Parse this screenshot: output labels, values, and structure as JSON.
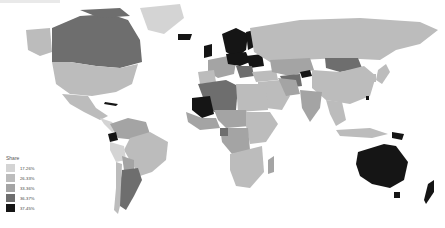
{
  "map": {
    "type": "choropleth",
    "projection": "world",
    "ocean_color": "#ffffff",
    "border_color": "#ffffff"
  },
  "legend": {
    "title": "Share",
    "items": [
      {
        "label": "17-26%",
        "color": "#d4d4d4"
      },
      {
        "label": "26-33%",
        "color": "#bcbcbc"
      },
      {
        "label": "33-36%",
        "color": "#a4a4a4"
      },
      {
        "label": "36-37%",
        "color": "#6e6e6e"
      },
      {
        "label": "37-45%",
        "color": "#151515"
      }
    ]
  },
  "regions": [
    {
      "name": "Canada",
      "bin": "36-37%"
    },
    {
      "name": "United States",
      "bin": "26-33%"
    },
    {
      "name": "Mexico",
      "bin": "26-33%"
    },
    {
      "name": "Greenland",
      "bin": "17-26%"
    },
    {
      "name": "Alaska",
      "bin": "26-33%"
    },
    {
      "name": "Brazil",
      "bin": "26-33%"
    },
    {
      "name": "Argentina",
      "bin": "36-37%"
    },
    {
      "name": "Ecuador",
      "bin": "37-45%"
    },
    {
      "name": "Mali",
      "bin": "37-45%"
    },
    {
      "name": "Algeria",
      "bin": "36-37%"
    },
    {
      "name": "Russia",
      "bin": "26-33%"
    },
    {
      "name": "Mongolia",
      "bin": "36-37%"
    },
    {
      "name": "Kyrgyzstan",
      "bin": "37-45%"
    },
    {
      "name": "Australia",
      "bin": "37-45%"
    },
    {
      "name": "New Zealand",
      "bin": "37-45%"
    },
    {
      "name": "Scandinavia",
      "bin": "37-45%"
    },
    {
      "name": "Iceland",
      "bin": "37-45%"
    }
  ]
}
